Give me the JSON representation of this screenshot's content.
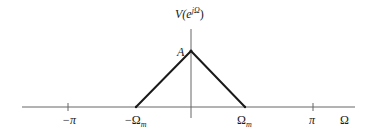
{
  "diagram": {
    "type": "spectrum-plot",
    "y_axis_label": {
      "base": "V(e",
      "sup": "jΩ",
      "close": ")"
    },
    "x_axis_label": "Ω",
    "peak_label": "A",
    "ticks": [
      {
        "id": "neg-pi",
        "label": "−π"
      },
      {
        "id": "neg-omega-m",
        "label": "−Ω",
        "sub": "m"
      },
      {
        "id": "omega-m",
        "label": "Ω",
        "sub": "m"
      },
      {
        "id": "pi",
        "label": "π"
      }
    ],
    "shape": {
      "kind": "triangle",
      "left_base": "−Ω_m",
      "peak": "A",
      "right_base": "Ω_m"
    },
    "colors": {
      "axis": "#555555",
      "curve": "#1a1a1a",
      "text": "#1a1a1a"
    }
  }
}
